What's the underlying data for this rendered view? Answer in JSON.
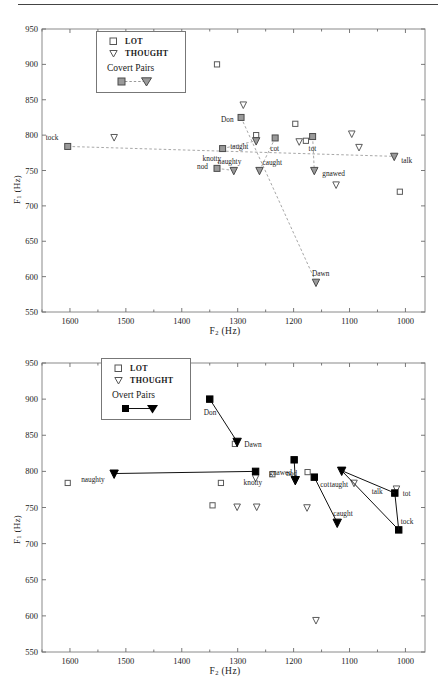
{
  "figure": {
    "panels": [
      {
        "id": "covert",
        "legend": {
          "lot": "LOT",
          "thought": "THOUGHT",
          "pairs_title": "Covert Pairs"
        }
      },
      {
        "id": "overt",
        "legend": {
          "lot": "LOT",
          "thought": "THOUGHT",
          "pairs_title": "Overt Pairs"
        }
      }
    ]
  },
  "chart_data": [
    {
      "type": "scatter",
      "title": "Covert Pairs",
      "xlabel": "F2 (Hz)",
      "ylabel": "F1 (Hz)",
      "xlim": [
        1650,
        965
      ],
      "ylim": [
        950,
        550
      ],
      "x_reversed": true,
      "y_reversed": true,
      "xticks": [
        1600,
        1500,
        1400,
        1300,
        1200,
        1100,
        1000
      ],
      "yticks": [
        550,
        600,
        650,
        700,
        750,
        800,
        850,
        900,
        950
      ],
      "minor_tick_step": 50,
      "grid": false,
      "legend_position": "top-left",
      "legend_entries": [
        "LOT",
        "THOUGHT",
        "Covert Pairs"
      ],
      "series": [
        {
          "name": "LOT",
          "marker": "open-square",
          "color": "#555555",
          "points": [
            {
              "x": 1267,
              "y": 800,
              "label": ""
            },
            {
              "x": 1197,
              "y": 816,
              "label": ""
            },
            {
              "x": 1178,
              "y": 792,
              "label": ""
            },
            {
              "x": 1010,
              "y": 720,
              "label": ""
            },
            {
              "x": 1337,
              "y": 900,
              "label": ""
            }
          ]
        },
        {
          "name": "THOUGHT",
          "marker": "open-triangle-down",
          "color": "#555555",
          "points": [
            {
              "x": 1521,
              "y": 797,
              "label": ""
            },
            {
              "x": 1190,
              "y": 791,
              "label": ""
            },
            {
              "x": 1124,
              "y": 730,
              "label": ""
            },
            {
              "x": 1096,
              "y": 802,
              "label": ""
            },
            {
              "x": 1083,
              "y": 783,
              "label": ""
            }
          ]
        },
        {
          "name": "Covert Pairs",
          "marker": "paired-filled-gray",
          "linestyle": "dashed",
          "color": "#808080",
          "pairs": [
            {
              "lot_label": "tock",
              "lot_x": 1604,
              "lot_y": 784,
              "thought_label": "talk",
              "thought_x": 1020,
              "thought_y": 770
            },
            {
              "lot_label": "nod",
              "lot_x": 1337,
              "lot_y": 753,
              "thought_label": "naughty",
              "thought_x": 1307,
              "thought_y": 750
            },
            {
              "lot_label": "knotty",
              "lot_x": 1327,
              "lot_y": 781,
              "thought_label": "taught",
              "thought_x": 1267,
              "thought_y": 792
            },
            {
              "lot_label": "cot",
              "lot_x": 1233,
              "lot_y": 796,
              "thought_label": "caught",
              "thought_x": 1261,
              "thought_y": 750
            },
            {
              "lot_label": "tot",
              "lot_x": 1166,
              "lot_y": 798,
              "thought_label": "gnawed",
              "thought_x": 1163,
              "thought_y": 750
            },
            {
              "lot_label": "Don",
              "lot_x": 1294,
              "lot_y": 825,
              "thought_label": "Dawn",
              "thought_x": 1160,
              "thought_y": 592
            }
          ],
          "extra_thought_points": [
            {
              "x": 1290,
              "y": 843,
              "label": ""
            }
          ]
        }
      ]
    },
    {
      "type": "scatter",
      "title": "Overt Pairs",
      "xlabel": "F2 (Hz)",
      "ylabel": "F1 (Hz)",
      "xlim": [
        1650,
        965
      ],
      "ylim": [
        950,
        550
      ],
      "x_reversed": true,
      "y_reversed": true,
      "xticks": [
        1600,
        1500,
        1400,
        1300,
        1200,
        1100,
        1000
      ],
      "yticks": [
        550,
        600,
        650,
        700,
        750,
        800,
        850,
        900,
        950
      ],
      "minor_tick_step": 50,
      "grid": false,
      "legend_position": "top-left",
      "legend_entries": [
        "LOT",
        "THOUGHT",
        "Overt Pairs"
      ],
      "series": [
        {
          "name": "LOT",
          "marker": "open-square",
          "color": "#555555",
          "points": [
            {
              "x": 1604,
              "y": 784,
              "label": ""
            },
            {
              "x": 1345,
              "y": 753,
              "label": ""
            },
            {
              "x": 1330,
              "y": 784,
              "label": ""
            },
            {
              "x": 1305,
              "y": 838,
              "label": ""
            },
            {
              "x": 1238,
              "y": 796,
              "label": ""
            },
            {
              "x": 1175,
              "y": 799,
              "label": ""
            }
          ]
        },
        {
          "name": "THOUGHT",
          "marker": "open-triangle-down",
          "color": "#555555",
          "points": [
            {
              "x": 1301,
              "y": 751,
              "label": ""
            },
            {
              "x": 1266,
              "y": 751,
              "label": ""
            },
            {
              "x": 1268,
              "y": 791,
              "label": ""
            },
            {
              "x": 1176,
              "y": 750,
              "label": ""
            },
            {
              "x": 1160,
              "y": 594,
              "label": ""
            },
            {
              "x": 1092,
              "y": 784,
              "label": ""
            },
            {
              "x": 1016,
              "y": 776,
              "label": ""
            }
          ]
        },
        {
          "name": "Overt Pairs",
          "marker": "paired-filled-black",
          "linestyle": "solid",
          "color": "#000000",
          "pairs": [
            {
              "lot_label": "knotty",
              "lot_x": 1268,
              "lot_y": 800,
              "thought_label": "naughty",
              "thought_x": 1521,
              "thought_y": 797
            },
            {
              "lot_label": "nod",
              "lot_x": 1199,
              "lot_y": 816,
              "thought_label": "gnawed",
              "thought_x": 1197,
              "thought_y": 788
            },
            {
              "lot_label": "cot",
              "lot_x": 1163,
              "lot_y": 792,
              "thought_label": "caught",
              "thought_x": 1122,
              "thought_y": 729
            },
            {
              "lot_label": "Don",
              "lot_x": 1350,
              "lot_y": 900,
              "thought_label": "Dawn",
              "thought_x": 1301,
              "thought_y": 841
            },
            {
              "lot_label": "tock",
              "lot_x": 1012,
              "lot_y": 719,
              "thought_label": "taught",
              "thought_x": 1114,
              "thought_y": 801
            }
          ],
          "connector_extra": [
            {
              "from_x": 1012,
              "from_y": 719,
              "to_x": 1019,
              "to_y": 770,
              "to_label": "talk"
            },
            {
              "from_x": 1019,
              "from_y": 770,
              "to_x": 1114,
              "to_y": 801,
              "to_label": ""
            }
          ],
          "extra_labels": [
            {
              "x": 1019,
              "y": 770,
              "label": "tot"
            }
          ]
        }
      ]
    }
  ]
}
